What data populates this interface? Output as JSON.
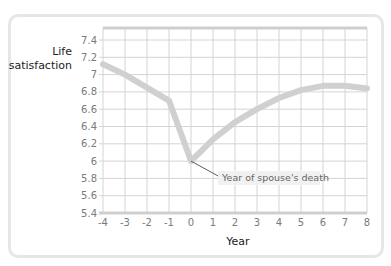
{
  "chart_data": {
    "type": "line",
    "title": "",
    "xlabel": "Year",
    "ylabel": "Life satisfaction",
    "x": [
      -4,
      -3,
      -2,
      -1,
      0,
      1,
      2,
      3,
      4,
      5,
      6,
      7,
      8
    ],
    "series": [
      {
        "name": "Life satisfaction",
        "values": [
          7.12,
          7.0,
          6.85,
          6.7,
          6.0,
          6.25,
          6.45,
          6.6,
          6.73,
          6.82,
          6.87,
          6.87,
          6.84
        ]
      }
    ],
    "xlim": [
      -4,
      8
    ],
    "ylim": [
      5.4,
      7.5
    ],
    "xticks": [
      "-4",
      "-3",
      "-2",
      "-1",
      "0",
      "1",
      "2",
      "3",
      "4",
      "5",
      "6",
      "7",
      "8"
    ],
    "yticks": [
      "5.4",
      "5.6",
      "5.8",
      "6",
      "6.2",
      "6.4",
      "6.6",
      "6.8",
      "7",
      "7.2",
      "7.4"
    ],
    "grid": true,
    "annotations": [
      {
        "text": "Year of spouse's death",
        "x": 0,
        "y": 6.0
      }
    ],
    "line_color": "#d0d0d0",
    "grid_color": "#d4d4d4"
  },
  "labels": {
    "ylabel_line1": "Life",
    "ylabel_line2": "satisfaction",
    "xlabel": "Year",
    "annotation": "Year of spouse's death"
  }
}
